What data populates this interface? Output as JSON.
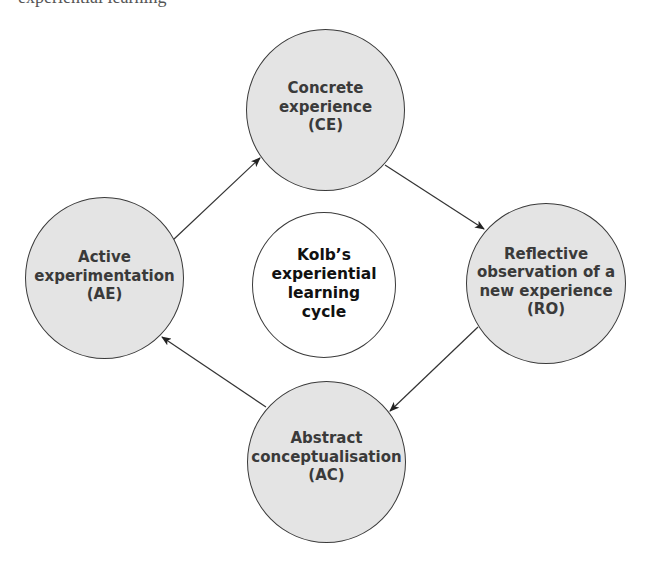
{
  "page": {
    "top_cut_text": "experiential learning"
  },
  "diagram": {
    "center": {
      "lines": [
        "Kolb’s",
        "experiential",
        "learning",
        "cycle"
      ]
    },
    "nodes": [
      {
        "id": "CE",
        "lines": [
          "Concrete",
          "experience",
          "(CE)"
        ]
      },
      {
        "id": "RO",
        "lines": [
          "Reflective",
          "observation of a",
          "new experience",
          "(RO)"
        ]
      },
      {
        "id": "AC",
        "lines": [
          "Abstract",
          "conceptualisation",
          "(AC)"
        ]
      },
      {
        "id": "AE",
        "lines": [
          "Active",
          "experimentation",
          "(AE)"
        ]
      }
    ],
    "edges": [
      {
        "from": "CE",
        "to": "RO"
      },
      {
        "from": "RO",
        "to": "AC"
      },
      {
        "from": "AC",
        "to": "AE"
      },
      {
        "from": "AE",
        "to": "CE"
      }
    ],
    "colors": {
      "node_fill": "#e4e4e4",
      "center_fill": "#ffffff",
      "stroke": "#3a3a3a",
      "text": "#3a3a3a"
    }
  }
}
